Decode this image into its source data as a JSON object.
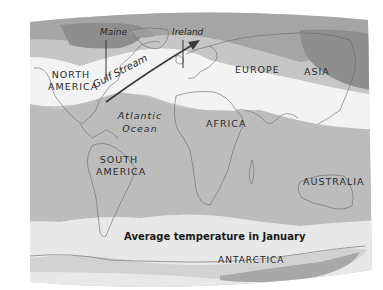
{
  "map": {
    "caption": "Average temperature in January",
    "theme": "grayscale temperature bands",
    "colors": {
      "background": "#ffffff",
      "coldest": "#8e8e8e",
      "cold": "#a9a9a9",
      "cool": "#c4c4c4",
      "mild": "#f2f2f2",
      "warm": "#bdbdbd",
      "hot": "#b0b0b0",
      "south_mild": "#e6e6e6",
      "coastline": "#555555"
    },
    "continents": {
      "north_america_1": "NORTH",
      "north_america_2": "AMERICA",
      "south_america_1": "SOUTH",
      "south_america_2": "AMERICA",
      "europe": "EUROPE",
      "asia": "ASIA",
      "africa": "AFRICA",
      "australia": "AUSTRALIA",
      "antarctica": "ANTARCTICA"
    },
    "places": {
      "maine": "Maine",
      "ireland": "Ireland"
    },
    "oceans": {
      "atlantic_1": "Atlantic",
      "atlantic_2": "Ocean"
    },
    "currents": {
      "gulf_stream": "Gulf Stream"
    }
  }
}
